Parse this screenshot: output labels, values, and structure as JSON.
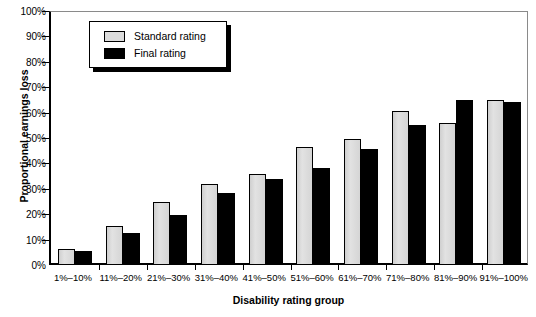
{
  "chart_data": {
    "type": "bar",
    "title": "",
    "xlabel": "Disability rating group",
    "ylabel": "Proportional earnings loss",
    "ylim": [
      0,
      100
    ],
    "ytick_labels": [
      "0%",
      "10%",
      "20%",
      "30%",
      "40%",
      "50%",
      "60%",
      "70%",
      "80%",
      "90%",
      "100%"
    ],
    "ytick_values": [
      0,
      10,
      20,
      30,
      40,
      50,
      60,
      70,
      80,
      90,
      100
    ],
    "grid": false,
    "legend_position": "top-left",
    "categories": [
      "1%–10%",
      "11%–20%",
      "21%–30%",
      "31%–40%",
      "41%–50%",
      "51%–60%",
      "61%–70%",
      "71%–80%",
      "81%–90%",
      "91%–100%"
    ],
    "series": [
      {
        "name": "Standard rating",
        "color": "#d8d8d8",
        "values": [
          6.5,
          15.5,
          25,
          32,
          36,
          46.5,
          49.5,
          60.5,
          56,
          65
        ]
      },
      {
        "name": "Final rating",
        "color": "#000000",
        "values": [
          5.5,
          12.5,
          19.5,
          28.5,
          34,
          38,
          45.5,
          55,
          65,
          64
        ]
      }
    ]
  },
  "legend": {
    "items": [
      {
        "label": "Standard rating",
        "swatch": "standard"
      },
      {
        "label": "Final rating",
        "swatch": "final"
      }
    ]
  },
  "colors": {
    "standard_fill": "#d8d8d8",
    "final_fill": "#000000",
    "axis": "#000000",
    "frame": "#8a8a8a",
    "background": "#ffffff"
  }
}
